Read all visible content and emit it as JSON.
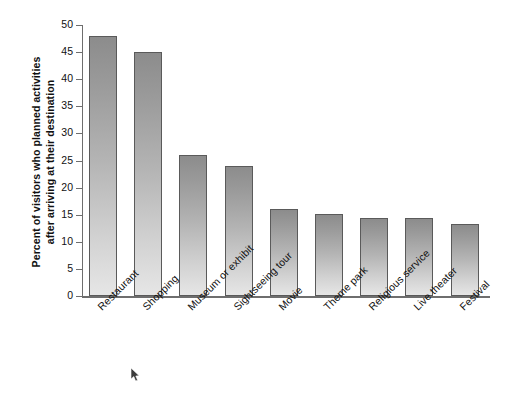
{
  "chart_data": {
    "type": "bar",
    "title": "",
    "subtitle": "",
    "xlabel": "",
    "ylabel": "Percent of visitors who planned activities after arriving at their destination",
    "ylabel_lines": [
      "Percent of visitors who planned activities",
      "after arriving at their destination"
    ],
    "categories": [
      "Restaurant",
      "Shopping",
      "Museum or exhibit",
      "Sightseeing tour",
      "Movie",
      "Theme park",
      "Religious service",
      "Live theater",
      "Festival"
    ],
    "values": [
      48,
      45,
      26,
      24,
      16,
      15.2,
      14.4,
      14.4,
      13.3
    ],
    "ylim": [
      0,
      50
    ],
    "yticks": [
      0,
      5,
      10,
      15,
      20,
      25,
      30,
      35,
      40,
      45,
      50
    ],
    "ytick_labels": [
      "0",
      "5",
      "10",
      "15",
      "20",
      "25",
      "30",
      "35",
      "40",
      "45",
      "50"
    ],
    "grid": false,
    "legend": false,
    "legend_position": "none",
    "bar_color_top": "#8c8c8c",
    "bar_color_bottom": "#e6e6e6",
    "bar_border_color": "#5a5a5a",
    "axis_color": "#6e6e6e",
    "background_color": "#ffffff"
  },
  "cursor": {
    "name": "mouse-pointer"
  }
}
